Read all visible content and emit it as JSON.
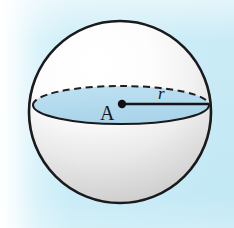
{
  "figure": {
    "kind": "sphere-diagram",
    "alt": "Sphere with center A and radius r drawn on the equatorial great circle",
    "background": {
      "base_color": "#c5eaf5",
      "fade_color": "#ffffff"
    },
    "sphere": {
      "name": "sphere",
      "outline_color": "#1a1a1c",
      "outline_width": 2.6,
      "fill_top_color": "#ffffff",
      "fill_bottom_color": "#d4d4d4",
      "center_x": 120,
      "center_y": 112,
      "radius": 91
    },
    "equator": {
      "name": "equatorial-circle",
      "fill_color": "#b4dcee",
      "edge_color": "#1a1a1c",
      "center_x": 121,
      "center_y": 105,
      "radius_x": 88,
      "radius_y": 19,
      "back_half_style": "dashed",
      "front_half_style": "solid"
    },
    "center_point": {
      "name": "center-point-A",
      "label": "A",
      "dot_color": "#101012",
      "dot_radius": 4,
      "x": 122,
      "y": 104
    },
    "radius_segment": {
      "name": "radius-segment",
      "label": "r",
      "line_color": "#151517",
      "line_width": 2.4,
      "from_x": 122,
      "from_y": 104,
      "to_x": 209,
      "to_y": 104
    }
  }
}
